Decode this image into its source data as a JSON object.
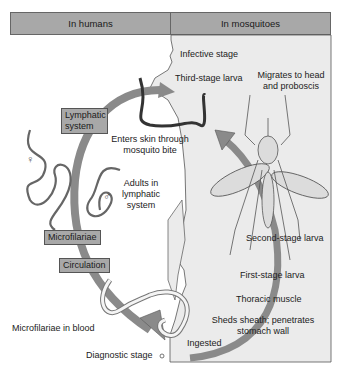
{
  "header": {
    "left_title": "In humans",
    "right_title": "In mosquitoes"
  },
  "human_labels": {
    "lymphatic_system_box": "Lymphatic system",
    "microfilariae_box": "Microfilariae",
    "circulation_box": "Circulation",
    "enters_skin": "Enters skin through mosquito bite",
    "adults_in_lymphatic": "Adults in lymphatic system",
    "microfilariae_in_blood": "Microfilariae in blood",
    "diagnostic_stage": "Diagnostic stage",
    "female_symbol": "♀",
    "male_symbol": "♂"
  },
  "mosquito_labels": {
    "infective_stage": "Infective stage",
    "third_stage_larva": "Third-stage larva",
    "migrates": "Migrates to head and proboscis",
    "second_stage_larva": "Second-stage larva",
    "first_stage_larva": "First-stage larva",
    "thoracic_muscle": "Thoracic muscle",
    "sheds_sheath": "Sheds sheath; penetrates stomach wall",
    "ingested": "Ingested"
  },
  "colors": {
    "header_fill": "#a8a8a8",
    "mosquito_panel": "#ebebeb",
    "arrow": "#8a8a8a",
    "box_fill": "#a8a8a8"
  }
}
